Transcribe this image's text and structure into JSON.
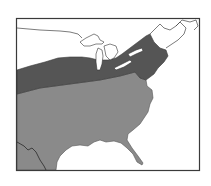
{
  "map": {
    "subject": "Range map of eastern United States",
    "region": "Eastern United States and southern Canada",
    "legend": [],
    "colors": {
      "background": "#ffffff",
      "frame": "#3a3a3a",
      "outline": "#2a2a2a",
      "northern_range": "#555555",
      "southern_range": "#8a8a8a",
      "water_land_boundary": "#444444"
    },
    "zones": [
      {
        "name": "northern-range-band",
        "shade": "dark"
      },
      {
        "name": "southern-range",
        "shade": "medium"
      }
    ]
  }
}
